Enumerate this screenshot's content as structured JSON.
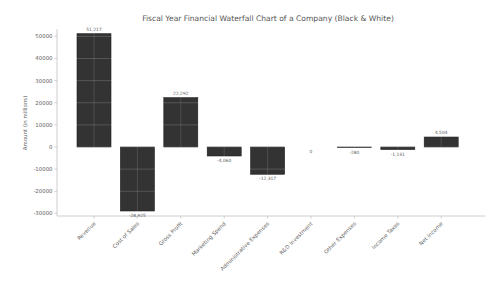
{
  "chart_data": {
    "type": "bar",
    "variant": "waterfall",
    "title": "Fiscal Year Financial Waterfall Chart of a Company (Black & White)",
    "xlabel": "",
    "ylabel": "Amount (in millions)",
    "categories": [
      "Revenue",
      "Cost of Sales",
      "Gross Profit",
      "Marketing Spend",
      "Administrative Expenses",
      "R&D Investment",
      "Other Expenses",
      "Income Taxes",
      "Net Income"
    ],
    "values": [
      51217,
      -28925,
      22292,
      -4060,
      -12317,
      0,
      -280,
      -1131,
      4504
    ],
    "value_labels": [
      "51,217",
      "-28,925",
      "22,292",
      "-4,060",
      "-12,317",
      "0",
      "-280",
      "-1,131",
      "4,504"
    ],
    "yticks": [
      50000,
      40000,
      30000,
      20000,
      10000,
      0,
      -10000,
      -20000,
      -30000
    ],
    "ytick_labels": [
      "50000",
      "40000",
      "30000",
      "20000",
      "10000",
      "0",
      "-10000",
      "-20000",
      "-30000"
    ],
    "ylim": [
      -33000,
      54000
    ],
    "grid": "white-gridlines-over-bars",
    "legend": null,
    "colors": {
      "bar_fill": "#333333",
      "bar_edge": "#1c1c1c",
      "axis_line": "#c2c2c2",
      "tick_text": "#5f5f5f",
      "title_text": "#555555",
      "value_label_text": "#595959",
      "background": "#ffffff"
    }
  }
}
